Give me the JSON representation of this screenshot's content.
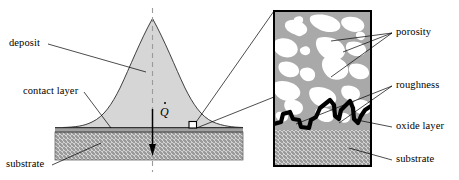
{
  "figure": {
    "labels": {
      "deposit": "deposit",
      "contact_layer": "contact layer",
      "substrate_left": "substrate",
      "porosity": "porosity",
      "roughness": "roughness",
      "oxide_layer": "oxide layer",
      "substrate_right": "substrate"
    },
    "symbols": {
      "heat_flux": "Q"
    },
    "colors": {
      "deposit_fill": "#d4d4d4",
      "contact_layer_fill": "#9a9a9a",
      "substrate_fill": "#c9c9c9",
      "inset_matrix_fill": "#a8a8a8",
      "porosity_fill": "#ffffff",
      "oxide_layer_stroke": "#000000",
      "outline_stroke": "#000000",
      "background": "#ffffff"
    }
  }
}
